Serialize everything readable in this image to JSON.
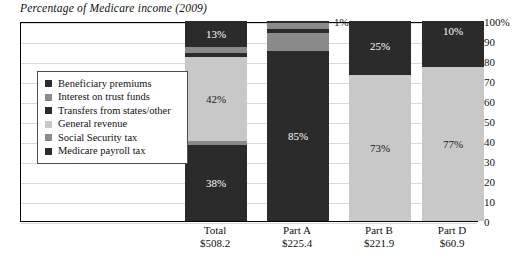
{
  "chart_data": {
    "type": "bar",
    "title": "Percentage of Medicare income (2009)",
    "xlabel": "",
    "ylabel": "",
    "ylim": [
      0,
      100
    ],
    "grid": true,
    "stacked": true,
    "legend_position": "inside-left",
    "categories": [
      "Total",
      "Part A",
      "Part B",
      "Part D"
    ],
    "category_values": [
      "$508.2",
      "$225.4",
      "$221.9",
      "$60.9"
    ],
    "ytick_labels": [
      "100%",
      "90",
      "80",
      "70",
      "60",
      "50",
      "40",
      "30",
      "20",
      "10",
      "0"
    ],
    "ytick_values": [
      100,
      90,
      80,
      70,
      60,
      50,
      40,
      30,
      20,
      10,
      0
    ],
    "series": [
      {
        "name": "Beneficiary premiums",
        "color": "#2b2b2b",
        "values": [
          13,
          1,
          25,
          10
        ],
        "labels": [
          "13%",
          "1%",
          "25%",
          "10%"
        ]
      },
      {
        "name": "Interest on trust funds",
        "color": "#8a8a8a",
        "values": [
          3,
          3,
          0,
          0
        ],
        "labels": [
          "",
          "",
          "",
          ""
        ]
      },
      {
        "name": "Transfers from states/other",
        "color": "#2b2b2b",
        "values": [
          2,
          2,
          2,
          13
        ],
        "labels": [
          "",
          "",
          "",
          ""
        ]
      },
      {
        "name": "General revenue",
        "color": "#c8c8c8",
        "values": [
          42,
          0,
          73,
          77
        ],
        "labels": [
          "42%",
          "",
          "73%",
          "77%"
        ]
      },
      {
        "name": "Social Security tax",
        "color": "#8a8a8a",
        "values": [
          2,
          9,
          0,
          0
        ],
        "labels": [
          "",
          "",
          "",
          ""
        ]
      },
      {
        "name": "Medicare payroll tax",
        "color": "#2b2b2b",
        "values": [
          38,
          85,
          0,
          0
        ],
        "labels": [
          "38%",
          "85%",
          "",
          ""
        ]
      }
    ]
  },
  "legend": {
    "items": [
      {
        "label": "Beneficiary premiums",
        "color": "#2b2b2b"
      },
      {
        "label": "Interest on trust funds",
        "color": "#8a8a8a"
      },
      {
        "label": "Transfers from states/other",
        "color": "#2b2b2b"
      },
      {
        "label": "General revenue",
        "color": "#c8c8c8"
      },
      {
        "label": "Social Security tax",
        "color": "#8a8a8a"
      },
      {
        "label": "Medicare payroll tax",
        "color": "#2b2b2b"
      }
    ]
  },
  "colors": {
    "dark": "#2b2b2b",
    "mid": "#8a8a8a",
    "light": "#c8c8c8",
    "frame": "#000000",
    "grid": "#d9d9d9",
    "background": "#ffffff"
  }
}
